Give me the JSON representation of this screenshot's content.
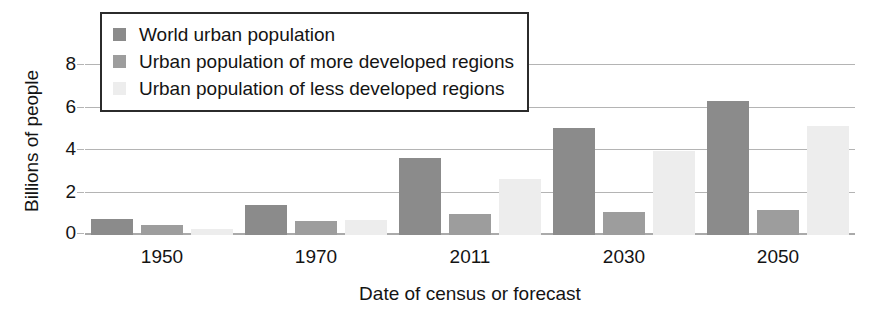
{
  "chart_data": {
    "type": "bar",
    "title": "",
    "xlabel": "Date of census or forecast",
    "ylabel": "Billions of people",
    "categories": [
      "1950",
      "1970",
      "2011",
      "2030",
      "2050"
    ],
    "ylim": [
      0,
      9
    ],
    "yticks": [
      0,
      2,
      4,
      6,
      8
    ],
    "ytick_labels": [
      "0",
      "2",
      "4",
      "6",
      "8"
    ],
    "grid": true,
    "legend_position": "top-left",
    "series": [
      {
        "name": "World urban population",
        "color": "#8b8b8b",
        "values": [
          0.75,
          1.4,
          3.65,
          5.05,
          6.3
        ]
      },
      {
        "name": "Urban population of more developed regions",
        "color": "#9d9d9d",
        "values": [
          0.45,
          0.68,
          1.0,
          1.1,
          1.2
        ]
      },
      {
        "name": "Urban population of less developed regions",
        "color": "#ededed",
        "values": [
          0.28,
          0.7,
          2.65,
          3.95,
          5.15
        ]
      }
    ]
  }
}
